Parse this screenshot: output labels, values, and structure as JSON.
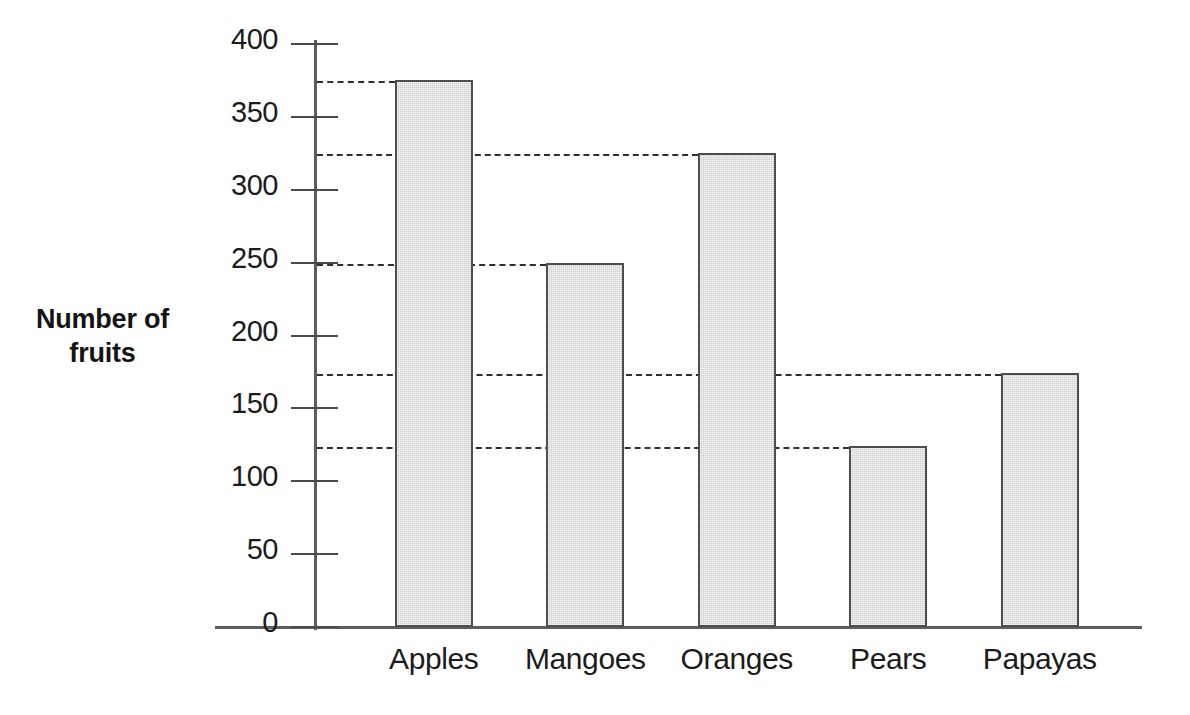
{
  "chart_data": {
    "type": "bar",
    "title": "",
    "subtitle": "",
    "xlabel": "",
    "ylabel": "Number of fruits",
    "ylabel_lines": [
      "Number of",
      "fruits"
    ],
    "categories": [
      "Apples",
      "Mangoes",
      "Oranges",
      "Pears",
      "Papayas"
    ],
    "values": [
      375,
      250,
      325,
      124,
      174
    ],
    "ylim": [
      0,
      400
    ],
    "ytick_values": [
      0,
      50,
      100,
      150,
      200,
      250,
      300,
      350,
      400
    ],
    "ytick_labels": [
      "0",
      "50",
      "100",
      "150",
      "200",
      "250",
      "300",
      "350",
      "400"
    ],
    "grid": false,
    "leader_lines": true,
    "legend": null,
    "legend_position": "none",
    "bar_fill_color": "#cfcfcf",
    "bar_edge_color": "#4e4e4e",
    "axis_color": "#5d5d5d",
    "leader_line_color": "#2e2e2e",
    "background_color": "#ffffff"
  }
}
